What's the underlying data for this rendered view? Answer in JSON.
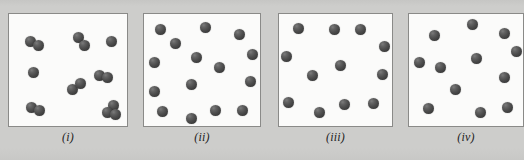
{
  "figure": {
    "background_color": "#cdcdcb",
    "panel_background_color": "#fbfbfa",
    "panel_border_color": "#8a8a88",
    "atom_color": "#4d4d4d",
    "atom_highlight_color": "#7b7b7b",
    "atom_diameter_px": 11,
    "panel_count": 4
  },
  "panels": [
    {
      "id": "panel-i",
      "caption": "(i)",
      "left": 8,
      "width": 120,
      "atom_count": 15,
      "molecule_count": 6,
      "single_atom_count": 3,
      "description": "diatomic molecules plus single atoms",
      "atoms": [
        {
          "x": 16,
          "y": 22,
          "d": 11
        },
        {
          "x": 24,
          "y": 26,
          "d": 11
        },
        {
          "x": 64,
          "y": 18,
          "d": 11
        },
        {
          "x": 70,
          "y": 26,
          "d": 11
        },
        {
          "x": 97,
          "y": 22,
          "d": 11
        },
        {
          "x": 19,
          "y": 53,
          "d": 11
        },
        {
          "x": 58,
          "y": 70,
          "d": 11
        },
        {
          "x": 66,
          "y": 64,
          "d": 11
        },
        {
          "x": 85,
          "y": 56,
          "d": 11
        },
        {
          "x": 93,
          "y": 58,
          "d": 11
        },
        {
          "x": 17,
          "y": 88,
          "d": 11
        },
        {
          "x": 25,
          "y": 91,
          "d": 11
        },
        {
          "x": 99,
          "y": 86,
          "d": 11
        },
        {
          "x": 93,
          "y": 93,
          "d": 11
        },
        {
          "x": 101,
          "y": 95,
          "d": 11
        }
      ]
    },
    {
      "id": "panel-ii",
      "caption": "(ii)",
      "left": 143,
      "width": 118,
      "atom_count": 15,
      "molecule_count": 0,
      "single_atom_count": 15,
      "description": "single atoms, dense",
      "atoms": [
        {
          "x": 11,
          "y": 10,
          "d": 11
        },
        {
          "x": 26,
          "y": 24,
          "d": 11
        },
        {
          "x": 56,
          "y": 8,
          "d": 11
        },
        {
          "x": 90,
          "y": 15,
          "d": 11
        },
        {
          "x": 103,
          "y": 35,
          "d": 11
        },
        {
          "x": 5,
          "y": 43,
          "d": 11
        },
        {
          "x": 47,
          "y": 38,
          "d": 11
        },
        {
          "x": 70,
          "y": 48,
          "d": 11
        },
        {
          "x": 5,
          "y": 72,
          "d": 11
        },
        {
          "x": 42,
          "y": 65,
          "d": 11
        },
        {
          "x": 101,
          "y": 62,
          "d": 11
        },
        {
          "x": 13,
          "y": 92,
          "d": 11
        },
        {
          "x": 42,
          "y": 99,
          "d": 11
        },
        {
          "x": 66,
          "y": 91,
          "d": 11
        },
        {
          "x": 93,
          "y": 91,
          "d": 11
        }
      ]
    },
    {
      "id": "panel-iii",
      "caption": "(iii)",
      "left": 278,
      "width": 115,
      "atom_count": 12,
      "molecule_count": 0,
      "single_atom_count": 12,
      "description": "single atoms, medium density",
      "atoms": [
        {
          "x": 14,
          "y": 9,
          "d": 11
        },
        {
          "x": 50,
          "y": 10,
          "d": 11
        },
        {
          "x": 76,
          "y": 10,
          "d": 11
        },
        {
          "x": 100,
          "y": 27,
          "d": 11
        },
        {
          "x": 2,
          "y": 37,
          "d": 11
        },
        {
          "x": 56,
          "y": 46,
          "d": 11
        },
        {
          "x": 28,
          "y": 56,
          "d": 11
        },
        {
          "x": 98,
          "y": 55,
          "d": 11
        },
        {
          "x": 4,
          "y": 83,
          "d": 11
        },
        {
          "x": 35,
          "y": 93,
          "d": 11
        },
        {
          "x": 60,
          "y": 85,
          "d": 11
        },
        {
          "x": 89,
          "y": 84,
          "d": 11
        }
      ]
    },
    {
      "id": "panel-iv",
      "caption": "(iv)",
      "left": 408,
      "width": 116,
      "atom_count": 13,
      "molecule_count": 0,
      "single_atom_count": 13,
      "description": "single atoms, medium density",
      "atoms": [
        {
          "x": 58,
          "y": 5,
          "d": 11
        },
        {
          "x": 20,
          "y": 16,
          "d": 11
        },
        {
          "x": 90,
          "y": 14,
          "d": 11
        },
        {
          "x": 102,
          "y": 32,
          "d": 11
        },
        {
          "x": 5,
          "y": 43,
          "d": 11
        },
        {
          "x": 62,
          "y": 39,
          "d": 11
        },
        {
          "x": 26,
          "y": 48,
          "d": 11
        },
        {
          "x": 90,
          "y": 58,
          "d": 11
        },
        {
          "x": 41,
          "y": 70,
          "d": 11
        },
        {
          "x": 14,
          "y": 89,
          "d": 11
        },
        {
          "x": 66,
          "y": 93,
          "d": 11
        },
        {
          "x": 93,
          "y": 88,
          "d": 11
        }
      ]
    }
  ]
}
